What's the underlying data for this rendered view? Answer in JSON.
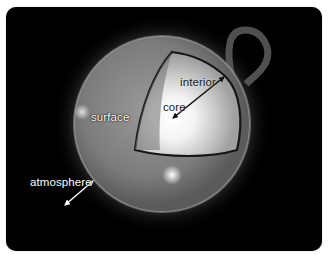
{
  "diagram": {
    "labels": {
      "interior": "interior",
      "core": "core",
      "surface": "surface",
      "atmosphere": "atmosphere"
    },
    "arrows": [
      {
        "name": "core-to-interior-arrow",
        "from": "core",
        "to": "interior edge",
        "color": "#111111",
        "style": "double-headed"
      },
      {
        "name": "atmosphere-arrow",
        "from": "surface edge",
        "to": "outer space",
        "color": "#ffffff",
        "style": "double-headed"
      }
    ],
    "colors": {
      "background": "#000000",
      "frame_border": "#ffffff",
      "sun_surface": "#7a7a7a",
      "core_glow": "#ffffff",
      "cutaway_outline": "#151515"
    }
  }
}
